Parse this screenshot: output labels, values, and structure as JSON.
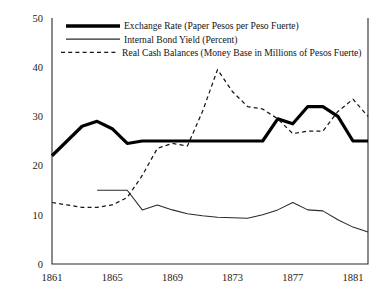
{
  "chart_data": {
    "type": "line",
    "title": "",
    "xlabel": "",
    "ylabel": "",
    "xlim": [
      1861,
      1882
    ],
    "ylim": [
      0,
      50
    ],
    "grid": false,
    "legend_position": "top-left",
    "x_ticks": [
      "1861",
      "1865",
      "1869",
      "1873",
      "1877",
      "1881"
    ],
    "x_tick_values": [
      1861,
      1865,
      1869,
      1873,
      1877,
      1881
    ],
    "y_ticks": [
      "0",
      "10",
      "20",
      "30",
      "40",
      "50"
    ],
    "y_tick_values": [
      0,
      10,
      20,
      30,
      40,
      50
    ],
    "x": [
      1861,
      1862,
      1863,
      1864,
      1865,
      1866,
      1867,
      1868,
      1869,
      1870,
      1871,
      1872,
      1873,
      1874,
      1875,
      1876,
      1877,
      1878,
      1879,
      1880,
      1881,
      1882
    ],
    "series": [
      {
        "name": "Exchange Rate (Paper Pesos per Peso Fuerte)",
        "style": "thick-solid",
        "color": "#000000",
        "values": [
          22.0,
          25.0,
          28.0,
          29.0,
          27.5,
          24.5,
          25.0,
          25.0,
          25.0,
          25.0,
          25.0,
          25.0,
          25.0,
          25.0,
          25.0,
          29.5,
          28.5,
          32.0,
          32.0,
          30.0,
          25.0,
          25.0
        ]
      },
      {
        "name": "Internal Bond Yield (Percent)",
        "style": "thin-solid",
        "color": "#2a2a2a",
        "start_year": 1864,
        "values": [
          null,
          null,
          null,
          15.0,
          15.0,
          15.0,
          11.0,
          12.0,
          11.0,
          10.2,
          9.8,
          9.5,
          9.4,
          9.3,
          10.0,
          11.0,
          12.5,
          11.0,
          10.8,
          9.0,
          7.5,
          6.5
        ]
      },
      {
        "name": "Real Cash Balances (Money Base in Millions of Pesos Fuerte)",
        "style": "dashed",
        "color": "#161616",
        "values": [
          12.5,
          12.0,
          11.5,
          11.5,
          12.0,
          13.5,
          18.0,
          23.5,
          24.5,
          24.0,
          31.0,
          39.5,
          35.0,
          32.0,
          31.5,
          29.5,
          26.5,
          27.0,
          27.0,
          31.0,
          33.5,
          30.0
        ]
      }
    ]
  },
  "legend": {
    "items": [
      {
        "label": "Exchange Rate (Paper Pesos per Peso Fuerte)",
        "style": "thick-solid"
      },
      {
        "label": "Internal Bond Yield (Percent)",
        "style": "thin-solid"
      },
      {
        "label": "Real Cash Balances (Money Base in Millions of Pesos Fuerte)",
        "style": "dashed"
      }
    ]
  }
}
